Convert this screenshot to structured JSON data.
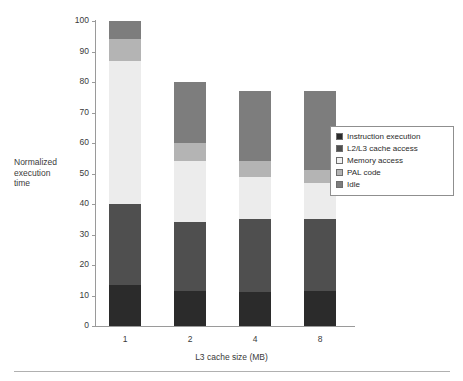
{
  "chart_data": {
    "type": "bar",
    "stacked": true,
    "title": "",
    "xlabel": "L3 cache size (MB)",
    "ylabel": "Normalized execution time",
    "ylabel_lines": [
      "Normalized",
      "execution",
      "time"
    ],
    "categories": [
      "1",
      "2",
      "4",
      "8"
    ],
    "ylim": [
      0,
      100
    ],
    "yticks": [
      0,
      10,
      20,
      30,
      40,
      50,
      60,
      70,
      80,
      90,
      100
    ],
    "grid": false,
    "legend_position": "right",
    "series": [
      {
        "name": "Instruction execution",
        "color": "#2b2b2b",
        "values": [
          13.5,
          11.5,
          11.0,
          11.5
        ]
      },
      {
        "name": "L2/L3 cache access",
        "color": "#4f4f4f",
        "values": [
          26.5,
          22.5,
          24.0,
          23.5
        ]
      },
      {
        "name": "Memory access",
        "color": "#ececec",
        "values": [
          47.0,
          20.0,
          14.0,
          12.0
        ]
      },
      {
        "name": "PAL code",
        "color": "#b4b4b4",
        "values": [
          7.0,
          6.0,
          5.0,
          4.0
        ]
      },
      {
        "name": "Idle",
        "color": "#7d7d7d",
        "values": [
          6.0,
          20.0,
          23.0,
          26.0
        ]
      }
    ],
    "totals": [
      100,
      80,
      77,
      77
    ]
  },
  "legend": {
    "items": [
      {
        "label": "Instruction execution",
        "color": "#2b2b2b"
      },
      {
        "label": "L2/L3 cache access",
        "color": "#4f4f4f"
      },
      {
        "label": "Memory access",
        "color": "#f2f2f2"
      },
      {
        "label": "PAL code",
        "color": "#b4b4b4"
      },
      {
        "label": "Idle",
        "color": "#7d7d7d"
      }
    ]
  }
}
